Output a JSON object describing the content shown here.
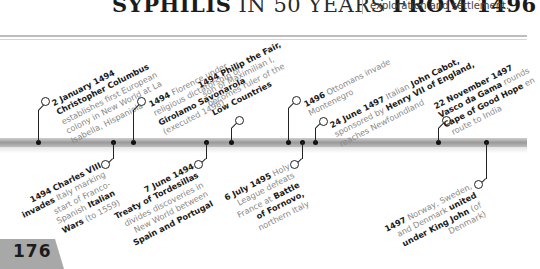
{
  "header": {
    "title_part1": "SYPHILIS",
    "title_part2": " IN 50 YEARS ",
    "title_part3": "FROM 1496",
    "subtitle": "exploration and settlement."
  },
  "page_number": "176",
  "timeline": {
    "top_events": [
      {
        "date": "2 January 1494",
        "lines": [
          "Christopher Columbus",
          "establishes first European",
          "colony in New World at La",
          "Isabella, Hispaniola"
        ]
      },
      {
        "date": "1494",
        "lines": [
          "Florence under",
          "religious dictatorship of",
          "Girolamo Savonarola",
          "(executed 1498)"
        ]
      },
      {
        "date": "1494",
        "lines": [
          "Philip the Fair,",
          "son of Maximilian I,",
          "becomes ruler of the",
          "Low Countries"
        ]
      },
      {
        "date": "1496",
        "lines": [
          "Ottomans invade",
          "Montenegro"
        ]
      },
      {
        "date": "24 June 1497",
        "lines": [
          "Italian John Cabot,",
          "sponsored by Henry VII of England,",
          "reaches Newfoundland"
        ]
      },
      {
        "date": "22 November 1497",
        "lines": [
          "Vasco da Gama rounds",
          "Cape of Good Hope en",
          "route to India"
        ]
      }
    ],
    "bottom_events": [
      {
        "date": "1494",
        "lines": [
          "Charles VIII",
          "invades Italy marking",
          "start of Franco-",
          "Spanish Italian",
          "Wars (to 1559)"
        ]
      },
      {
        "date": "7 June 1494",
        "lines": [
          "Treaty of Tordesillas",
          "divides discoveries in",
          "New World between",
          "Spain and Portugal"
        ]
      },
      {
        "date": "6 July 1495",
        "lines": [
          "Holy",
          "League defeats",
          "France at Battle",
          "of Fornovo,",
          "northern Italy"
        ]
      },
      {
        "date": "1497",
        "lines": [
          "Norway, Sweden,",
          "and Denmark united",
          "under King John (of",
          "Denmark)"
        ]
      }
    ]
  },
  "colors": {
    "bar": "#a8a8a8",
    "text_dark": "#1a1a1a",
    "text_light": "#888888",
    "page_tab": "#a8a8a8"
  }
}
